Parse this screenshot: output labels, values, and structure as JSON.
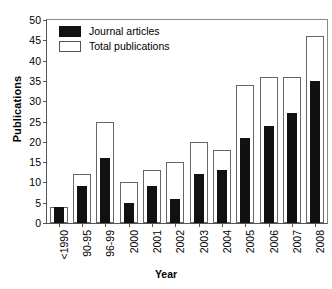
{
  "chart_data": {
    "type": "bar",
    "title": "",
    "xlabel": "Year",
    "ylabel": "Publications",
    "categories": [
      "<1990",
      "90-95",
      "96-99",
      "2000",
      "2001",
      "2002",
      "2003",
      "2004",
      "2005",
      "2006",
      "2007",
      "2008"
    ],
    "series": [
      {
        "name": "Total publications",
        "style": "open",
        "values": [
          4,
          12,
          25,
          10,
          13,
          15,
          20,
          18,
          34,
          36,
          36,
          46
        ]
      },
      {
        "name": "Journal articles",
        "style": "filled",
        "values": [
          4,
          9,
          16,
          5,
          9,
          6,
          12,
          13,
          21,
          24,
          27,
          35
        ]
      }
    ],
    "ylim": [
      0,
      50
    ],
    "ytick_values": [
      0,
      5,
      10,
      15,
      20,
      25,
      30,
      35,
      40,
      45,
      50
    ],
    "ytick_labels": [
      "0",
      "5",
      "10",
      "15",
      "20",
      "25",
      "30",
      "35",
      "40",
      "45",
      "50"
    ],
    "grid": false,
    "legend_position": "top-left",
    "bar_mode": "overlaid",
    "colors": {
      "journal_articles": "#111111",
      "total_publications": "#ffffff",
      "axis": "#555555",
      "frame": "#8a8a8a",
      "text": "#000000",
      "background": "#ffffff"
    }
  },
  "legend": {
    "entries": [
      {
        "label": "Journal articles"
      },
      {
        "label": "Total publications"
      }
    ]
  }
}
